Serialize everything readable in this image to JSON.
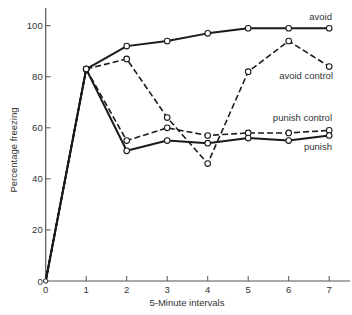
{
  "chart_data": {
    "type": "line",
    "title": "",
    "xlabel": "5-Minute intervals",
    "ylabel": "Percentage freezing",
    "x": [
      0,
      1,
      2,
      3,
      4,
      5,
      6,
      7
    ],
    "xticks": [
      "0",
      "1",
      "2",
      "3",
      "4",
      "5",
      "6",
      "7"
    ],
    "yticks": [
      "0",
      "20",
      "40",
      "60",
      "80",
      "100"
    ],
    "xlim": [
      0,
      7.5
    ],
    "ylim": [
      0,
      107
    ],
    "grid": false,
    "legend_position": "inline labels at right end of lines",
    "series": [
      {
        "name": "avoid",
        "style": "solid",
        "values": [
          0,
          83,
          92,
          94,
          97,
          99,
          99,
          99
        ]
      },
      {
        "name": "avoid control",
        "style": "dashed",
        "values": [
          0,
          83,
          87,
          64,
          46,
          82,
          94,
          84
        ]
      },
      {
        "name": "punish control",
        "style": "dashed",
        "values": [
          0,
          83,
          55,
          60,
          57,
          58,
          58,
          59
        ]
      },
      {
        "name": "punish",
        "style": "solid",
        "values": [
          0,
          83,
          51,
          55,
          54,
          56,
          55,
          57
        ]
      }
    ]
  },
  "colors": {
    "line": "#1a1a1a",
    "axis": "#555555",
    "marker_fill": "#ffffff"
  }
}
